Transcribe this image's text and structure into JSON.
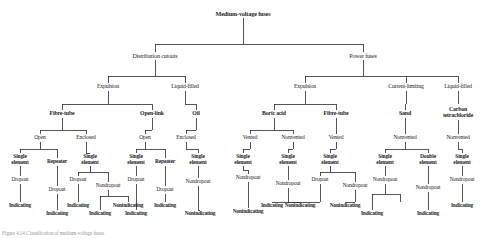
{
  "figure": {
    "caption": "Figure 4.14  Classification of medium-voltage fuses.",
    "line_color": "#2b2b2b",
    "text_color": "#1c1c1c",
    "background": "#ffffff"
  },
  "nodes": {
    "root": {
      "label": "Medium-voltage fuses",
      "x": 243,
      "y": 14,
      "level": "lvl-root"
    },
    "distribution_cutouts": {
      "label": "Distribution cutouts",
      "x": 155,
      "y": 56,
      "level": "lvl-1"
    },
    "power_fuses": {
      "label": "Power fuses",
      "x": 363,
      "y": 56,
      "level": "lvl-1"
    },
    "dc_expulsion": {
      "label": "Expulsion",
      "x": 108,
      "y": 87,
      "level": "lvl-2"
    },
    "dc_liquid_filled": {
      "label": "Liquid-filled",
      "x": 185,
      "y": 87,
      "level": "lvl-2"
    },
    "pf_expulsion": {
      "label": "Expulsion",
      "x": 305,
      "y": 87,
      "level": "lvl-2"
    },
    "pf_current_limiting": {
      "label": "Current-limiting",
      "x": 406,
      "y": 87,
      "level": "lvl-2"
    },
    "pf_liquid_filled": {
      "label": "Liquid-filled",
      "x": 458,
      "y": 87,
      "level": "lvl-2"
    },
    "fibre_tube_a": {
      "label": "Fibre-tube",
      "x": 62,
      "y": 114,
      "level": "lvl-3"
    },
    "open_link": {
      "label": "Open-link",
      "x": 152,
      "y": 114,
      "level": "lvl-3"
    },
    "oil": {
      "label": "Oil",
      "x": 196,
      "y": 114,
      "level": "lvl-3"
    },
    "boric_acid": {
      "label": "Boric acid",
      "x": 274,
      "y": 114,
      "level": "lvl-3"
    },
    "fibre_tube_b": {
      "label": "Fibre-tube",
      "x": 336,
      "y": 114,
      "level": "lvl-3"
    },
    "sand": {
      "label": "Sand",
      "x": 405,
      "y": 114,
      "level": "lvl-3"
    },
    "carbon_tet": {
      "label": "Carbon\ntetrachloride",
      "x": 458,
      "y": 111,
      "level": "lvl-3"
    },
    "ft_a_open": {
      "label": "Open",
      "x": 40,
      "y": 138,
      "level": "lvl-4"
    },
    "ft_a_enclosed": {
      "label": "Enclosed",
      "x": 86,
      "y": 138,
      "level": "lvl-4"
    },
    "ol_open": {
      "label": "Open",
      "x": 145,
      "y": 138,
      "level": "lvl-4"
    },
    "oil_enclosed": {
      "label": "Enclosed",
      "x": 186,
      "y": 138,
      "level": "lvl-4"
    },
    "ba_vented": {
      "label": "Vented",
      "x": 250,
      "y": 138,
      "level": "lvl-4"
    },
    "ba_nonvented": {
      "label": "Nonvented",
      "x": 293,
      "y": 138,
      "level": "lvl-4"
    },
    "ft_b_vented": {
      "label": "Vented",
      "x": 336,
      "y": 138,
      "level": "lvl-4"
    },
    "sand_nonvented": {
      "label": "Nonvented",
      "x": 405,
      "y": 138,
      "level": "lvl-4"
    },
    "ct_nonvented": {
      "label": "Nonvented",
      "x": 458,
      "y": 138,
      "level": "lvl-4"
    },
    "se1": {
      "label": "Single\nelement",
      "x": 20,
      "y": 158,
      "level": "lvl-5"
    },
    "rep1": {
      "label": "Repeater",
      "x": 57,
      "y": 162,
      "level": "lvl-5"
    },
    "se2": {
      "label": "Single\nelement",
      "x": 90,
      "y": 158,
      "level": "lvl-5"
    },
    "se3": {
      "label": "Single\nelement",
      "x": 136,
      "y": 158,
      "level": "lvl-5"
    },
    "rep2": {
      "label": "Repeater",
      "x": 165,
      "y": 162,
      "level": "lvl-5"
    },
    "se4": {
      "label": "Single\nelement",
      "x": 198,
      "y": 158,
      "level": "lvl-5"
    },
    "se5": {
      "label": "Single\nelement",
      "x": 243,
      "y": 158,
      "level": "lvl-5"
    },
    "se6": {
      "label": "Single\nelement",
      "x": 288,
      "y": 158,
      "level": "lvl-5"
    },
    "se7": {
      "label": "Single\nelement",
      "x": 330,
      "y": 158,
      "level": "lvl-5"
    },
    "se8": {
      "label": "Single\nelement",
      "x": 385,
      "y": 158,
      "level": "lvl-5"
    },
    "de1": {
      "label": "Double\nelement",
      "x": 428,
      "y": 158,
      "level": "lvl-5"
    },
    "se9": {
      "label": "Single\nelement",
      "x": 462,
      "y": 158,
      "level": "lvl-5"
    },
    "dr1": {
      "label": "Dropout",
      "x": 20,
      "y": 180,
      "level": "lvl-6"
    },
    "dr2": {
      "label": "Dropout",
      "x": 57,
      "y": 190,
      "level": "lvl-6"
    },
    "dr3": {
      "label": "Dropout",
      "x": 78,
      "y": 180,
      "level": "lvl-6"
    },
    "ndr1": {
      "label": "Nondropout",
      "x": 108,
      "y": 186,
      "level": "lvl-6"
    },
    "dr4": {
      "label": "Dropout",
      "x": 136,
      "y": 180,
      "level": "lvl-6"
    },
    "dr5": {
      "label": "Dropout",
      "x": 165,
      "y": 190,
      "level": "lvl-6"
    },
    "ndr2": {
      "label": "Nondropout",
      "x": 198,
      "y": 182,
      "level": "lvl-6"
    },
    "ndr3": {
      "label": "Nondropout",
      "x": 248,
      "y": 178,
      "level": "lvl-6"
    },
    "ndr4": {
      "label": "Nondropout",
      "x": 288,
      "y": 184,
      "level": "lvl-6"
    },
    "dr6": {
      "label": "Dropout",
      "x": 320,
      "y": 180,
      "level": "lvl-6"
    },
    "ndr5": {
      "label": "Nondropout",
      "x": 355,
      "y": 186,
      "level": "lvl-6"
    },
    "ndr6": {
      "label": "Nondropout",
      "x": 385,
      "y": 180,
      "level": "lvl-6"
    },
    "ndr7": {
      "label": "Nondropout",
      "x": 428,
      "y": 188,
      "level": "lvl-6"
    },
    "ndr8": {
      "label": "Nondropout",
      "x": 462,
      "y": 180,
      "level": "lvl-6"
    },
    "ind1": {
      "label": "Indicating",
      "x": 20,
      "y": 206,
      "level": "lvl-7"
    },
    "ind2": {
      "label": "Indicating",
      "x": 57,
      "y": 214,
      "level": "lvl-7"
    },
    "ind3": {
      "label": "Indicating",
      "x": 78,
      "y": 206,
      "level": "lvl-7"
    },
    "ind4": {
      "label": "Indicating",
      "x": 100,
      "y": 214,
      "level": "lvl-7"
    },
    "nind1": {
      "label": "Nonindicating",
      "x": 128,
      "y": 206,
      "level": "lvl-7"
    },
    "ind5": {
      "label": "Indicating",
      "x": 136,
      "y": 214,
      "level": "lvl-7"
    },
    "ind6": {
      "label": "Indicating",
      "x": 165,
      "y": 206,
      "level": "lvl-7"
    },
    "nind2": {
      "label": "Nonindicating",
      "x": 200,
      "y": 214,
      "level": "lvl-7"
    },
    "nind3": {
      "label": "Nonindicating",
      "x": 248,
      "y": 212,
      "level": "lvl-7"
    },
    "ind7": {
      "label": "Indicating",
      "x": 272,
      "y": 206,
      "level": "lvl-7"
    },
    "nind4": {
      "label": "Nonindicating",
      "x": 300,
      "y": 206,
      "level": "lvl-7"
    },
    "nind5": {
      "label": "Nonindicating",
      "x": 345,
      "y": 206,
      "level": "lvl-7"
    },
    "ind8": {
      "label": "Indicating",
      "x": 372,
      "y": 214,
      "level": "lvl-7"
    },
    "ind9": {
      "label": "Indicating",
      "x": 428,
      "y": 214,
      "level": "lvl-7"
    },
    "ind10": {
      "label": "Indicating",
      "x": 462,
      "y": 206,
      "level": "lvl-7"
    }
  },
  "edges": [
    {
      "from": "root",
      "to_group": [
        "distribution_cutouts",
        "power_fuses"
      ],
      "type": "elbow"
    }
  ]
}
